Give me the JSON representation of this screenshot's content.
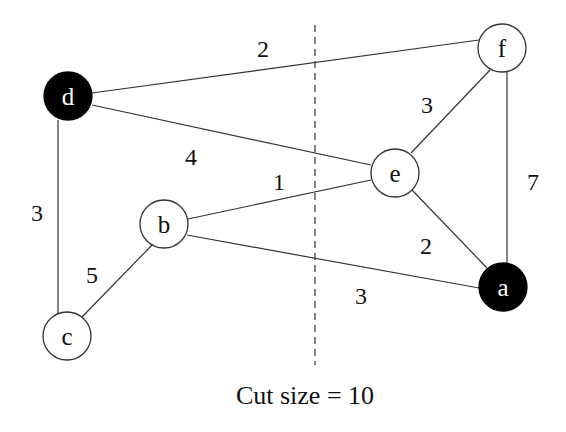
{
  "diagram": {
    "type": "graph-cut",
    "caption": "Cut size = 10",
    "nodes": [
      {
        "id": "d",
        "label": "d",
        "fill": "#000000",
        "x": 68,
        "y": 96
      },
      {
        "id": "f",
        "label": "f",
        "fill": "#ffffff",
        "x": 502,
        "y": 48
      },
      {
        "id": "e",
        "label": "e",
        "fill": "#ffffff",
        "x": 395,
        "y": 173
      },
      {
        "id": "b",
        "label": "b",
        "fill": "#ffffff",
        "x": 164,
        "y": 224
      },
      {
        "id": "a",
        "label": "a",
        "fill": "#000000",
        "x": 503,
        "y": 287
      },
      {
        "id": "c",
        "label": "c",
        "fill": "#ffffff",
        "x": 67,
        "y": 336
      }
    ],
    "edges": [
      {
        "from": "d",
        "to": "f",
        "weight": "2"
      },
      {
        "from": "d",
        "to": "e",
        "weight": "4"
      },
      {
        "from": "d",
        "to": "c",
        "weight": "3"
      },
      {
        "from": "f",
        "to": "e",
        "weight": "3"
      },
      {
        "from": "f",
        "to": "a",
        "weight": "7"
      },
      {
        "from": "e",
        "to": "b",
        "weight": "1"
      },
      {
        "from": "e",
        "to": "a",
        "weight": "2"
      },
      {
        "from": "b",
        "to": "a",
        "weight": "3"
      },
      {
        "from": "b",
        "to": "c",
        "weight": "5"
      }
    ],
    "cut_line": {
      "style": "dashed",
      "x": 315,
      "y1": 25,
      "y2": 365
    }
  }
}
